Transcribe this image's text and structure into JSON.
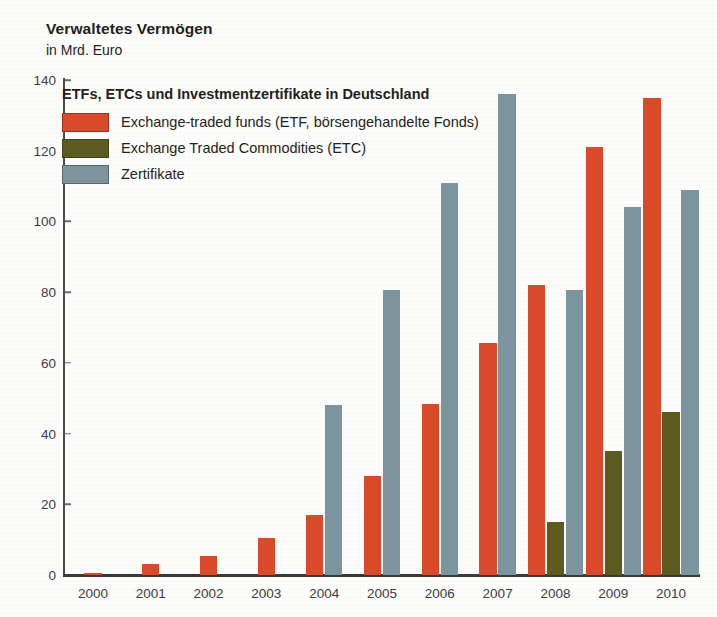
{
  "chart_data": {
    "type": "bar",
    "title": "Verwaltetes Vermögen",
    "subtitle": "in Mrd. Euro",
    "xlabel": "",
    "ylabel": "in Mrd. Euro",
    "legend_title": "ETFs, ETCs und Investmentzertifikate in Deutschland",
    "legend_position": "inside-top-left",
    "grid": false,
    "ylim": [
      0,
      140
    ],
    "yticks": [
      0,
      20,
      40,
      60,
      80,
      100,
      120,
      140
    ],
    "ytick_labels": [
      "0",
      "20",
      "40",
      "60",
      "80",
      "100",
      "120",
      "140"
    ],
    "categories": [
      "2000",
      "2001",
      "2002",
      "2003",
      "2004",
      "2005",
      "2006",
      "2007",
      "2008",
      "2009",
      "2010"
    ],
    "series": [
      {
        "name": "Exchange-traded funds (ETF, börsengehandelte Fonds)",
        "key": "etf",
        "color": "#d94a2b",
        "values": [
          0.5,
          3,
          5.5,
          10.5,
          17,
          28,
          48.5,
          65.5,
          82,
          121,
          135
        ]
      },
      {
        "name": "Exchange Traded Commodities (ETC)",
        "key": "etc",
        "color": "#5d5a20",
        "values": [
          0,
          0,
          0,
          0,
          0,
          0,
          0,
          0,
          15,
          35,
          46
        ]
      },
      {
        "name": "Zertifikate",
        "key": "zert",
        "color": "#7b949d",
        "values": [
          0,
          0,
          0,
          0,
          48,
          80.5,
          111,
          136,
          80.5,
          104,
          109
        ]
      }
    ]
  },
  "colors": {
    "etf": "#d94a2b",
    "etc": "#5d5a20",
    "zertifikate": "#7b949d",
    "axis": "#3a3a3a",
    "text": "#231f20",
    "background": "#fdfdfc"
  }
}
